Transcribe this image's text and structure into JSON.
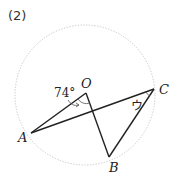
{
  "problem_number": "(2)",
  "circle": {
    "cx": 85,
    "cy": 95,
    "r": 70,
    "stroke": "#bbbbbb",
    "style": "dotted"
  },
  "points": {
    "O": {
      "label": "O",
      "x": 86,
      "y": 93
    },
    "A": {
      "label": "A",
      "x": 31,
      "y": 133
    },
    "B": {
      "label": "B",
      "x": 109,
      "y": 157
    },
    "C": {
      "label": "C",
      "x": 154,
      "y": 89
    }
  },
  "angles": {
    "AOB": {
      "label": "74°"
    },
    "ACB": {
      "label": "ウ"
    }
  },
  "segments": [
    "OA",
    "OB",
    "AC",
    "CB"
  ],
  "line_color": "#222222"
}
